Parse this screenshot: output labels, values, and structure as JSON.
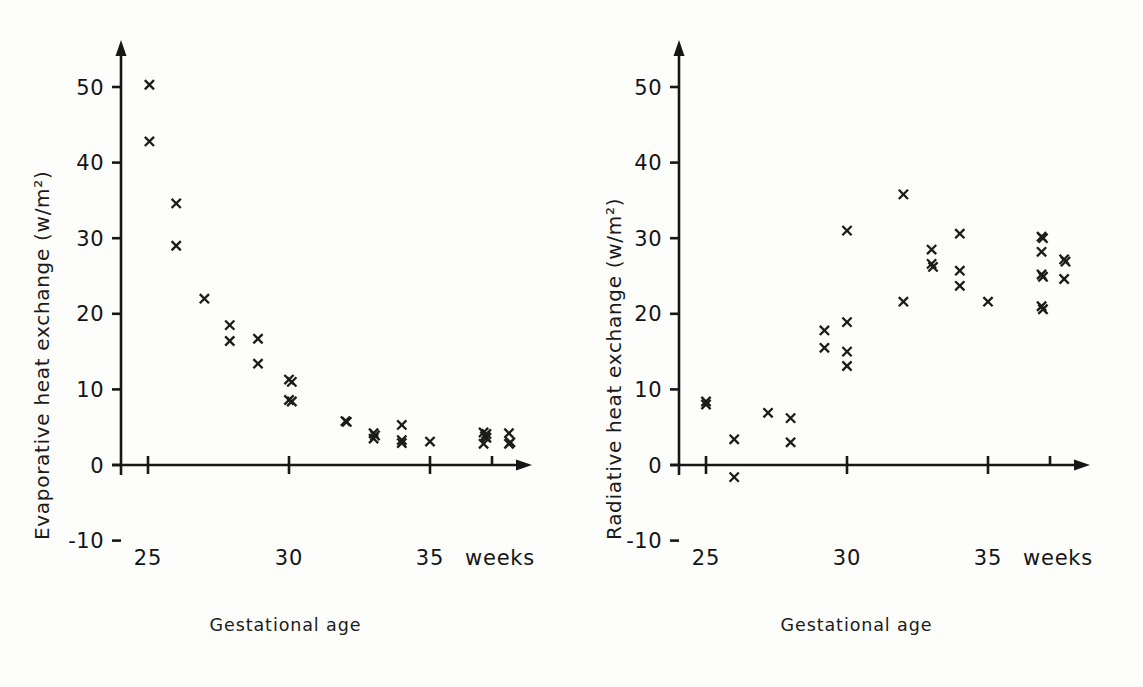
{
  "figure": {
    "background_color": "#fdfdfb",
    "ink_color": "#171717",
    "marker_symbol": "x"
  },
  "panels": [
    {
      "id": "left",
      "ylabel": "Evaporative heat exchange (w/m²)",
      "xcaption": "Gestational age",
      "xaxis_unit_label": "weeks"
    },
    {
      "id": "right",
      "ylabel": "Radiative heat exchange (w/m²)",
      "xcaption": "Gestational age",
      "xaxis_unit_label": "weeks"
    }
  ],
  "chart_data": [
    {
      "type": "scatter",
      "title": "",
      "xlabel": "Gestational age",
      "ylabel": "Evaporative heat exchange (w/m2)",
      "xunit": "weeks",
      "yunit": "w/m2",
      "xlim": [
        24.3,
        38.6
      ],
      "ylim": [
        -13,
        55
      ],
      "xticks": [
        25,
        30,
        35
      ],
      "xticklabels": [
        "25",
        "30",
        "35",
        "weeks"
      ],
      "yticks": [
        -10,
        0,
        10,
        20,
        30,
        40,
        50
      ],
      "yticklabels": [
        "-10",
        "0",
        "10",
        "20",
        "30",
        "40",
        "50"
      ],
      "grid": false,
      "legend": null,
      "marker": "x",
      "points": [
        {
          "x": 25.05,
          "y": 50.3
        },
        {
          "x": 25.05,
          "y": 42.8
        },
        {
          "x": 26.0,
          "y": 34.6
        },
        {
          "x": 26.0,
          "y": 29.0
        },
        {
          "x": 27.0,
          "y": 22.0
        },
        {
          "x": 27.9,
          "y": 18.5
        },
        {
          "x": 27.9,
          "y": 16.4
        },
        {
          "x": 28.9,
          "y": 16.7
        },
        {
          "x": 28.9,
          "y": 13.4
        },
        {
          "x": 30.0,
          "y": 11.3
        },
        {
          "x": 30.1,
          "y": 11.0
        },
        {
          "x": 30.0,
          "y": 8.6
        },
        {
          "x": 30.1,
          "y": 8.4
        },
        {
          "x": 32.0,
          "y": 5.8
        },
        {
          "x": 32.05,
          "y": 5.7
        },
        {
          "x": 33.0,
          "y": 4.2
        },
        {
          "x": 33.05,
          "y": 3.9
        },
        {
          "x": 33.0,
          "y": 3.5
        },
        {
          "x": 34.0,
          "y": 5.3
        },
        {
          "x": 34.0,
          "y": 3.3
        },
        {
          "x": 34.0,
          "y": 2.9
        },
        {
          "x": 35.0,
          "y": 3.1
        },
        {
          "x": 36.9,
          "y": 4.3
        },
        {
          "x": 37.0,
          "y": 4.1
        },
        {
          "x": 36.95,
          "y": 3.8
        },
        {
          "x": 37.0,
          "y": 3.6
        },
        {
          "x": 36.9,
          "y": 2.8
        },
        {
          "x": 37.8,
          "y": 4.2
        },
        {
          "x": 37.85,
          "y": 3.0
        },
        {
          "x": 37.8,
          "y": 2.8
        }
      ]
    },
    {
      "type": "scatter",
      "title": "",
      "xlabel": "Gestational age",
      "ylabel": "Radiative heat exchange (w/m2)",
      "xunit": "weeks",
      "yunit": "w/m2",
      "xlim": [
        24.3,
        38.6
      ],
      "ylim": [
        -13,
        55
      ],
      "xticks": [
        25,
        30,
        35
      ],
      "xticklabels": [
        "25",
        "30",
        "35",
        "weeks"
      ],
      "yticks": [
        -10,
        0,
        10,
        20,
        30,
        40,
        50
      ],
      "yticklabels": [
        "-10",
        "0",
        "10",
        "20",
        "30",
        "40",
        "50"
      ],
      "grid": false,
      "legend": null,
      "marker": "x",
      "points": [
        {
          "x": 25.0,
          "y": 8.4
        },
        {
          "x": 25.0,
          "y": 8.0
        },
        {
          "x": 26.0,
          "y": 3.4
        },
        {
          "x": 26.0,
          "y": -1.6
        },
        {
          "x": 27.2,
          "y": 6.9
        },
        {
          "x": 28.0,
          "y": 6.2
        },
        {
          "x": 28.0,
          "y": 3.0
        },
        {
          "x": 29.2,
          "y": 17.8
        },
        {
          "x": 29.2,
          "y": 15.5
        },
        {
          "x": 30.0,
          "y": 31.0
        },
        {
          "x": 30.0,
          "y": 18.9
        },
        {
          "x": 30.0,
          "y": 15.0
        },
        {
          "x": 30.0,
          "y": 13.1
        },
        {
          "x": 32.0,
          "y": 35.8
        },
        {
          "x": 32.0,
          "y": 21.6
        },
        {
          "x": 33.0,
          "y": 28.5
        },
        {
          "x": 33.0,
          "y": 26.6
        },
        {
          "x": 33.05,
          "y": 26.2
        },
        {
          "x": 34.0,
          "y": 30.6
        },
        {
          "x": 34.0,
          "y": 25.7
        },
        {
          "x": 34.0,
          "y": 23.7
        },
        {
          "x": 35.0,
          "y": 21.6
        },
        {
          "x": 36.9,
          "y": 30.2
        },
        {
          "x": 36.95,
          "y": 30.0
        },
        {
          "x": 36.9,
          "y": 28.2
        },
        {
          "x": 36.9,
          "y": 25.2
        },
        {
          "x": 36.95,
          "y": 24.9
        },
        {
          "x": 36.9,
          "y": 21.0
        },
        {
          "x": 36.95,
          "y": 20.6
        },
        {
          "x": 37.7,
          "y": 27.2
        },
        {
          "x": 37.75,
          "y": 26.9
        },
        {
          "x": 37.7,
          "y": 24.6
        }
      ]
    }
  ]
}
